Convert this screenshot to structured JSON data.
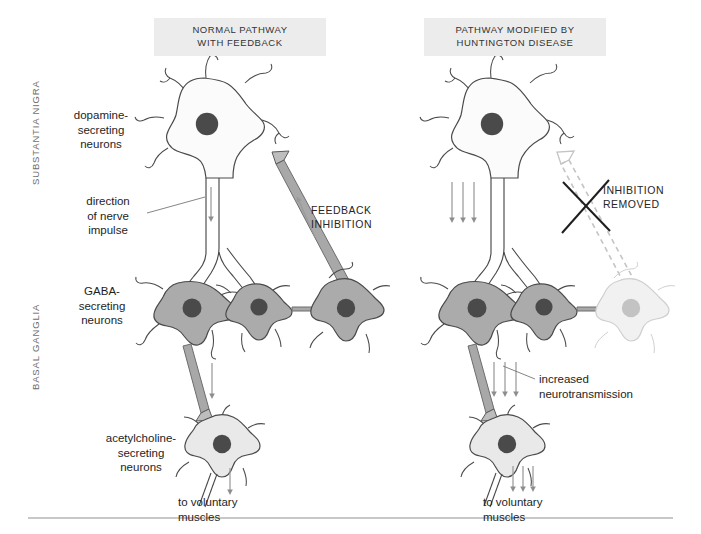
{
  "figure": {
    "background_color": "#ffffff",
    "banner_color": "#ececec",
    "ink_color": "#4a4a4a",
    "arrow_color": "#8d8d8d"
  },
  "panels": {
    "left": {
      "banner": "NORMAL PATHWAY\nWITH FEEDBACK"
    },
    "right": {
      "banner": "PATHWAY MODIFIED BY\nHUNTINGTON DISEASE"
    }
  },
  "regions": [
    {
      "id": "substantia-nigra",
      "label": "SUBSTANTIA NIGRA"
    },
    {
      "id": "basal-ganglia",
      "label": "BASAL GANGLIA"
    }
  ],
  "labels": {
    "dopamine": "dopamine-\nsecreting\nneurons",
    "direction": "direction\nof nerve\nimpulse",
    "gaba": "GABA-\nsecreting\nneurons",
    "acetylcholine": "acetylcholine-\nsecreting\nneurons",
    "to_muscles_left": "to voluntary\nmuscles",
    "to_muscles_right": "to voluntary\nmuscles",
    "feedback_inhibition": "FEEDBACK\nINHIBITION",
    "inhibition_removed": "INHIBITION\nREMOVED",
    "increased_neurotransmission": "increased\nneurotransmission"
  },
  "neuron_colors": {
    "dopamine_body": "#fbfbfb",
    "dopamine_nucleus": "#4a4a4a",
    "gaba_body": "#ababab",
    "gaba_nucleus": "#4a4a4a",
    "acetylcholine_body": "#e9e9e9",
    "acetylcholine_nucleus": "#4a4a4a",
    "degenerated_body": "#f1f1f1",
    "degenerated_nucleus": "#c3c3c3",
    "axon_fill": "#a8a8a8",
    "outline": "#4a4a4a",
    "faded_outline": "#c8c8c8"
  },
  "arrow_counts": {
    "normal_descending": 1,
    "normal_gaba_to_ach": 1,
    "normal_to_muscles": 1,
    "huntington_descending": 3,
    "huntington_gaba_to_ach": 3,
    "huntington_to_muscles": 3
  },
  "footer_rule": {
    "color": "#b6b6b6",
    "y": 518
  }
}
